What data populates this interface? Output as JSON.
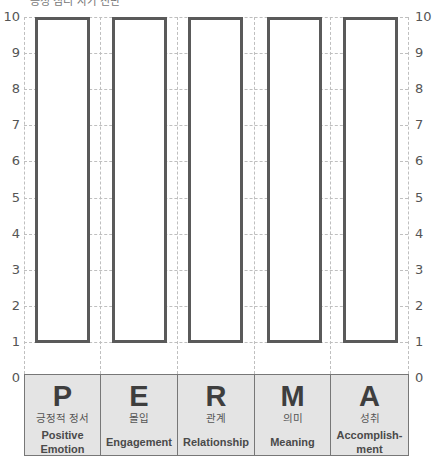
{
  "header": {
    "title": "긍정 심리 자가 진단"
  },
  "chart_data": {
    "type": "bar",
    "title": "",
    "xlabel": "",
    "ylabel": "",
    "ylim": [
      0,
      10
    ],
    "yticks": [
      0,
      1,
      2,
      3,
      4,
      5,
      6,
      7,
      8,
      9,
      10
    ],
    "grid": true,
    "categories": [
      "P",
      "E",
      "R",
      "M",
      "A"
    ],
    "category_labels": [
      {
        "letter": "P",
        "korean": "긍정적 정서",
        "english_line1": "Positive",
        "english_line2": "Emotion"
      },
      {
        "letter": "E",
        "korean": "몰입",
        "english_line1": "Engagement",
        "english_line2": ""
      },
      {
        "letter": "R",
        "korean": "관계",
        "english_line1": "Relationship",
        "english_line2": ""
      },
      {
        "letter": "M",
        "korean": "의미",
        "english_line1": "Meaning",
        "english_line2": ""
      },
      {
        "letter": "A",
        "korean": "성취",
        "english_line1": "Accomplish-",
        "english_line2": "ment"
      }
    ],
    "series": [
      {
        "name": "range_min",
        "values": [
          1,
          1,
          1,
          1,
          1
        ]
      },
      {
        "name": "range_max",
        "values": [
          10,
          10,
          10,
          10,
          10
        ]
      }
    ],
    "note": "Empty outlined bars spanning 1 to 10 for each PERMA element (blank worksheet)"
  },
  "axis": {
    "left_ticks": [
      "10",
      "9",
      "8",
      "7",
      "6",
      "5",
      "4",
      "3",
      "2",
      "1",
      "0"
    ],
    "right_ticks": [
      "10",
      "9",
      "8",
      "7",
      "6",
      "5",
      "4",
      "3",
      "2",
      "1",
      "0"
    ]
  },
  "colors": {
    "bar_outline": "#5a5a5a",
    "category_bg": "#e4e4e4",
    "grid": "#bfbfbf",
    "text": "#444444"
  }
}
